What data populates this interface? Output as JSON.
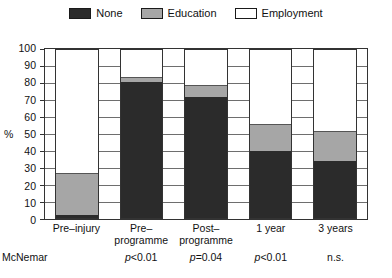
{
  "legend": {
    "items": [
      {
        "label": "None",
        "swatch": "legend-swatch-none",
        "color": "#2b2b2b"
      },
      {
        "label": "Education",
        "swatch": "legend-swatch-education",
        "color": "#a6a6a6"
      },
      {
        "label": "Employment",
        "swatch": "legend-swatch-employment",
        "color": "#ffffff"
      }
    ]
  },
  "axes": {
    "y_title": "%",
    "y_ticks": [
      "100",
      "90",
      "80",
      "70",
      "60",
      "50",
      "40",
      "30",
      "20",
      "10",
      "0"
    ]
  },
  "mcnemar": {
    "row_label": "McNemar",
    "values": [
      "",
      "p<0.01",
      "p=0.04",
      "p<0.01",
      "n.s."
    ]
  },
  "chart_data": {
    "type": "bar",
    "title": "",
    "xlabel": "",
    "ylabel": "%",
    "ylim": [
      0,
      100
    ],
    "ytick_step": 10,
    "grid": true,
    "legend_position": "top-center",
    "stacked": true,
    "categories": [
      "Pre-injury",
      "Pre-programme",
      "Post-programme",
      "1 year",
      "3 years"
    ],
    "category_lines": [
      [
        "Pre–injury",
        ""
      ],
      [
        "Pre–",
        "programme"
      ],
      [
        "Post–",
        "programme"
      ],
      [
        "1 year",
        ""
      ],
      [
        "3 years",
        ""
      ]
    ],
    "series": [
      {
        "name": "None",
        "color": "#2b2b2b",
        "values": [
          2,
          81,
          72,
          40,
          34
        ]
      },
      {
        "name": "Education",
        "color": "#a6a6a6",
        "values": [
          25,
          3,
          7,
          16,
          18
        ]
      },
      {
        "name": "Employment",
        "color": "#ffffff",
        "values": [
          73,
          16,
          21,
          44,
          48
        ]
      }
    ],
    "cumulative_tops": {
      "none": [
        2,
        81,
        72,
        40,
        34
      ],
      "education": [
        27,
        84,
        79,
        56,
        52
      ]
    },
    "annotations": [
      "McNemar p<0.01",
      "McNemar p=0.04",
      "McNemar p<0.01",
      "McNemar n.s."
    ]
  }
}
